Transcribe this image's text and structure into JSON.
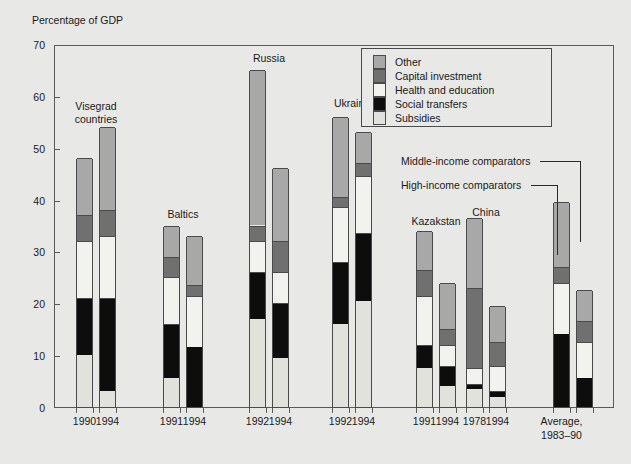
{
  "axis_title": "Percentage of GDP",
  "legend": {
    "items": [
      {
        "label": "Other",
        "color": "#a8a8a8"
      },
      {
        "label": "Capital investment",
        "color": "#707070"
      },
      {
        "label": "Health and education",
        "color": "#f2f2ee"
      },
      {
        "label": "Social transfers",
        "color": "#0d0d0d"
      },
      {
        "label": "Subsidies",
        "color": "#e2e2dd"
      }
    ]
  },
  "annotations": [
    {
      "text": "Middle-income comparators"
    },
    {
      "text": "High-income comparators"
    }
  ],
  "chart_data": {
    "type": "bar",
    "title": "",
    "subtitle": "",
    "xlabel": "",
    "ylabel": "Percentage of GDP",
    "ylim": [
      0,
      70
    ],
    "yticks": [
      0,
      10,
      20,
      30,
      40,
      50,
      60,
      70
    ],
    "grid": false,
    "legend_position": "top-right",
    "stacked": true,
    "series": [
      {
        "name": "Subsidies",
        "color": "#e2e2dd"
      },
      {
        "name": "Social transfers",
        "color": "#0d0d0d"
      },
      {
        "name": "Health and education",
        "color": "#f2f2ee"
      },
      {
        "name": "Capital investment",
        "color": "#707070"
      },
      {
        "name": "Other",
        "color": "#a8a8a8"
      }
    ],
    "groups": [
      {
        "name": "Visegrad countries",
        "bars": [
          {
            "category": "1990",
            "total": 48,
            "segments": {
              "Subsidies": 10,
              "Social transfers": 11,
              "Health and education": 11,
              "Capital investment": 5,
              "Other": 11
            }
          },
          {
            "category": "1994",
            "total": 54,
            "segments": {
              "Subsidies": 3,
              "Social transfers": 18,
              "Health and education": 12,
              "Capital investment": 5,
              "Other": 16
            }
          }
        ]
      },
      {
        "name": "Baltics",
        "bars": [
          {
            "category": "1991",
            "total": 35,
            "segments": {
              "Subsidies": 5.5,
              "Social transfers": 10.5,
              "Health and education": 9,
              "Capital investment": 4,
              "Other": 6
            }
          },
          {
            "category": "1994",
            "total": 33,
            "segments": {
              "Subsidies": 0,
              "Social transfers": 11.5,
              "Health and education": 10,
              "Capital investment": 2,
              "Other": 9.5
            }
          }
        ]
      },
      {
        "name": "Russia",
        "bars": [
          {
            "category": "1992",
            "total": 65,
            "segments": {
              "Subsidies": 17,
              "Social transfers": 9,
              "Health and education": 6,
              "Capital investment": 3,
              "Other": 30
            }
          },
          {
            "category": "1994",
            "total": 46,
            "segments": {
              "Subsidies": 9.5,
              "Social transfers": 10.5,
              "Health and education": 6,
              "Capital investment": 6,
              "Other": 14
            }
          }
        ]
      },
      {
        "name": "Ukraine",
        "bars": [
          {
            "category": "1992",
            "total": 56,
            "segments": {
              "Subsidies": 16,
              "Social transfers": 12,
              "Health and education": 10.5,
              "Capital investment": 2,
              "Other": 15.5
            }
          },
          {
            "category": "1994",
            "total": 53,
            "segments": {
              "Subsidies": 20.5,
              "Social transfers": 13,
              "Health and education": 11,
              "Capital investment": 2.5,
              "Other": 6
            }
          }
        ]
      },
      {
        "name": "Kazakstan",
        "bars": [
          {
            "category": "1991",
            "total": 34,
            "segments": {
              "Subsidies": 7.5,
              "Social transfers": 4.5,
              "Health and education": 9.5,
              "Capital investment": 5,
              "Other": 7.5
            }
          },
          {
            "category": "1994",
            "total": 24,
            "segments": {
              "Subsidies": 4,
              "Social transfers": 4,
              "Health and education": 4,
              "Capital investment": 3,
              "Other": 9
            }
          }
        ]
      },
      {
        "name": "China",
        "bars": [
          {
            "category": "1978",
            "total": 36.5,
            "segments": {
              "Subsidies": 3.5,
              "Social transfers": 1,
              "Health and education": 3,
              "Capital investment": 15.5,
              "Other": 13.5
            }
          },
          {
            "category": "1994",
            "total": 19.5,
            "segments": {
              "Subsidies": 2,
              "Social transfers": 1,
              "Health and education": 5,
              "Capital investment": 4.5,
              "Other": 7
            }
          }
        ]
      },
      {
        "name": "",
        "bars": [
          {
            "category": "Average,\n1983–90",
            "total": 39.5,
            "annotation": "High-income comparators",
            "segments": {
              "Subsidies": 0,
              "Social transfers": 14,
              "Health and education": 10,
              "Capital investment": 3,
              "Other": 12.5
            }
          },
          {
            "category": "",
            "total": 22.5,
            "annotation": "Middle-income comparators",
            "segments": {
              "Subsidies": 0,
              "Social transfers": 5.5,
              "Health and education": 7,
              "Capital investment": 4,
              "Other": 6
            }
          }
        ]
      }
    ]
  }
}
